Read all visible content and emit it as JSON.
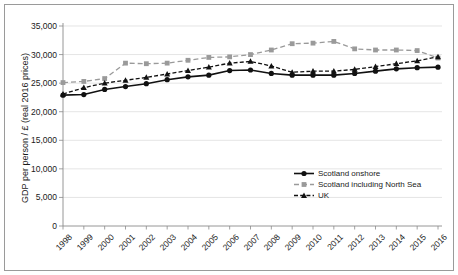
{
  "chart_data": {
    "type": "line",
    "title": "",
    "xlabel": "",
    "ylabel": "GDP per person / £ (real 2016 prices)",
    "ylim": [
      0,
      35000
    ],
    "ytick_labels": [
      "35,000",
      "30,000",
      "25,000",
      "20,000",
      "15,000",
      "10,000",
      "5,000",
      "0"
    ],
    "ytick_values": [
      35000,
      30000,
      25000,
      20000,
      15000,
      10000,
      5000,
      0
    ],
    "grid": "horizontal",
    "legend_position": "inside-lower-right",
    "categories": [
      "1998",
      "1999",
      "2000",
      "2001",
      "2002",
      "2003",
      "2004",
      "2005",
      "2006",
      "2007",
      "2008",
      "2009",
      "2010",
      "2011",
      "2012",
      "2013",
      "2014",
      "2015",
      "2016"
    ],
    "x": [
      1998,
      1999,
      2000,
      2001,
      2002,
      2003,
      2004,
      2005,
      2006,
      2007,
      2008,
      2009,
      2010,
      2011,
      2012,
      2013,
      2014,
      2015,
      2016
    ],
    "series": [
      {
        "name": "Scotland onshore",
        "marker": "circle",
        "line_style": "solid",
        "color": "#111111",
        "values": [
          22900,
          23000,
          23900,
          24400,
          24900,
          25600,
          26100,
          26400,
          27200,
          27300,
          26700,
          26400,
          26400,
          26400,
          26700,
          27100,
          27500,
          27700,
          27800
        ]
      },
      {
        "name": "Scotland including North Sea",
        "marker": "square",
        "line_style": "dashed",
        "color": "#9a9a9a",
        "values": [
          25100,
          25300,
          25800,
          28500,
          28400,
          28500,
          29000,
          29500,
          29600,
          30000,
          30800,
          31900,
          32000,
          32300,
          31000,
          30800,
          30800,
          30700,
          29400
        ]
      },
      {
        "name": "UK",
        "marker": "triangle",
        "line_style": "dashdot",
        "color": "#111111",
        "values": [
          23100,
          24200,
          25000,
          25500,
          26000,
          26600,
          27200,
          27800,
          28500,
          28800,
          28000,
          26900,
          27100,
          27100,
          27400,
          27900,
          28400,
          28900,
          29600
        ]
      }
    ]
  },
  "legend": {
    "entries": [
      {
        "label": "Scotland onshore"
      },
      {
        "label": "Scotland including North Sea"
      },
      {
        "label": "UK"
      }
    ]
  }
}
